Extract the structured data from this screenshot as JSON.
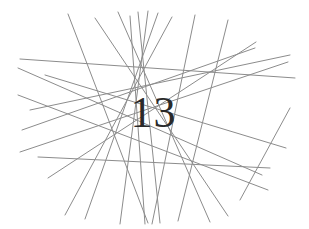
{
  "captcha": {
    "name": "captcha-challenge",
    "text": "13",
    "digits": [
      "1",
      "3"
    ],
    "width": 309,
    "height": 229,
    "background_color": "#ffffff",
    "text_color": "#2a2a2a",
    "line_color": "#8c8c8c",
    "line_width": 1,
    "line_count": 20,
    "convergence_points": [
      {
        "x": 148,
        "y": 45
      },
      {
        "x": 146,
        "y": 163
      },
      {
        "x": 145,
        "y": 190
      }
    ],
    "lines": [
      {
        "x1": 20,
        "y1": 59,
        "x2": 295,
        "y2": 78
      },
      {
        "x1": 38,
        "y1": 157,
        "x2": 270,
        "y2": 168
      },
      {
        "x1": 68,
        "y1": 14,
        "x2": 148,
        "y2": 223
      },
      {
        "x1": 95,
        "y1": 18,
        "x2": 228,
        "y2": 216
      },
      {
        "x1": 118,
        "y1": 12,
        "x2": 210,
        "y2": 222
      },
      {
        "x1": 130,
        "y1": 16,
        "x2": 145,
        "y2": 224
      },
      {
        "x1": 138,
        "y1": 12,
        "x2": 160,
        "y2": 223
      },
      {
        "x1": 148,
        "y1": 11,
        "x2": 120,
        "y2": 224
      },
      {
        "x1": 158,
        "y1": 13,
        "x2": 85,
        "y2": 219
      },
      {
        "x1": 172,
        "y1": 17,
        "x2": 65,
        "y2": 215
      },
      {
        "x1": 195,
        "y1": 15,
        "x2": 152,
        "y2": 224
      },
      {
        "x1": 228,
        "y1": 20,
        "x2": 178,
        "y2": 221
      },
      {
        "x1": 18,
        "y1": 68,
        "x2": 262,
        "y2": 175
      },
      {
        "x1": 18,
        "y1": 95,
        "x2": 268,
        "y2": 190
      },
      {
        "x1": 22,
        "y1": 130,
        "x2": 255,
        "y2": 48
      },
      {
        "x1": 20,
        "y1": 152,
        "x2": 288,
        "y2": 62
      },
      {
        "x1": 30,
        "y1": 110,
        "x2": 290,
        "y2": 55
      },
      {
        "x1": 45,
        "y1": 75,
        "x2": 286,
        "y2": 148
      },
      {
        "x1": 256,
        "y1": 42,
        "x2": 48,
        "y2": 178
      },
      {
        "x1": 240,
        "y1": 200,
        "x2": 290,
        "y2": 108
      }
    ]
  }
}
